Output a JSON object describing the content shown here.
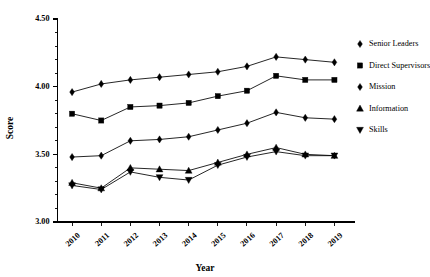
{
  "chart_data": {
    "type": "line",
    "title": "",
    "xlabel": "Year",
    "ylabel": "Score",
    "categories": [
      "2010",
      "2011",
      "2012",
      "2013",
      "2014",
      "2015",
      "2016",
      "2017",
      "2018",
      "2019"
    ],
    "x": [
      2010,
      2011,
      2012,
      2013,
      2014,
      2015,
      2016,
      2017,
      2018,
      2019
    ],
    "ylim": [
      3.0,
      4.5
    ],
    "yticks": [
      "3.00",
      "3.50",
      "4.00",
      "4.50"
    ],
    "ytick_values": [
      3.0,
      3.5,
      4.0,
      4.5
    ],
    "minor_ticks_per_interval": 4,
    "grid": false,
    "legend_position": "right",
    "series": [
      {
        "name": "Senior Leaders",
        "marker": "diamond",
        "values": [
          3.96,
          4.02,
          4.05,
          4.07,
          4.09,
          4.11,
          4.15,
          4.22,
          4.2,
          4.18
        ]
      },
      {
        "name": "Direct Supervisors",
        "marker": "square",
        "values": [
          3.8,
          3.75,
          3.85,
          3.86,
          3.88,
          3.93,
          3.97,
          4.08,
          4.05,
          4.05
        ]
      },
      {
        "name": "Mission",
        "marker": "diamond",
        "values": [
          3.48,
          3.49,
          3.6,
          3.61,
          3.63,
          3.68,
          3.73,
          3.81,
          3.77,
          3.76
        ]
      },
      {
        "name": "Information",
        "marker": "triangle-up",
        "values": [
          3.29,
          3.25,
          3.4,
          3.39,
          3.38,
          3.44,
          3.5,
          3.55,
          3.5,
          3.49
        ]
      },
      {
        "name": "Skills",
        "marker": "triangle-down",
        "values": [
          3.27,
          3.24,
          3.37,
          3.33,
          3.31,
          3.42,
          3.48,
          3.52,
          3.49,
          3.49
        ]
      }
    ]
  },
  "legend": {
    "entries": [
      {
        "label": "Senior Leaders",
        "marker": "diamond"
      },
      {
        "label": "Direct Supervisors",
        "marker": "square"
      },
      {
        "label": "Mission",
        "marker": "diamond"
      },
      {
        "label": "Information",
        "marker": "triangle-up"
      },
      {
        "label": "Skills",
        "marker": "triangle-down"
      }
    ]
  },
  "colors": {
    "line": "#000000",
    "marker": "#000000",
    "axis": "#000000",
    "background": "#ffffff"
  }
}
